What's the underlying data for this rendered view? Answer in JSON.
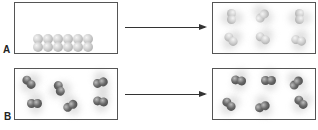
{
  "figure": {
    "rows": [
      {
        "label": "A",
        "description": "Light diatomic molecules packed in a row (condensed) transition to scattered, moving molecules (gas)",
        "before": {
          "state": "packed-row",
          "molecule_color": "light-gray",
          "molecule_count": 6
        },
        "after": {
          "state": "dispersed",
          "molecule_color": "light-gray",
          "molecule_count": 6
        }
      },
      {
        "label": "B",
        "description": "Dark diatomic molecules dispersed with motion blur before and after",
        "before": {
          "state": "dispersed",
          "molecule_color": "dark-gray",
          "molecule_count": 6
        },
        "after": {
          "state": "dispersed",
          "molecule_color": "dark-gray",
          "molecule_count": 6
        }
      }
    ],
    "arrow_icon": "right-arrow-icon",
    "colors": {
      "border": "#555555",
      "arrow": "#333333",
      "light_atom": "#c8c8c8",
      "dark_atom": "#5a5a5a"
    }
  }
}
